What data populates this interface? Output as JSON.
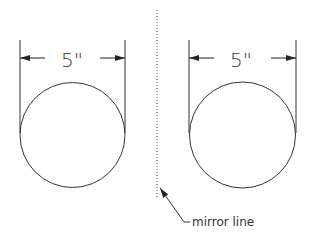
{
  "diagram": {
    "left_circle": {
      "dimension_label": "5\""
    },
    "right_circle": {
      "dimension_label": "5\""
    },
    "mirror_line": {
      "label": "mirror line"
    },
    "colors": {
      "stroke": "#333333",
      "background": "#ffffff"
    }
  }
}
